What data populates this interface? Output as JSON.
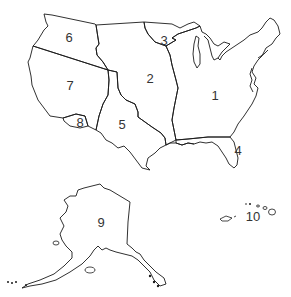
{
  "map": {
    "type": "outline-map",
    "subject": "United States divided into numbered regions",
    "stroke_color": "#1a1a1a",
    "background": "#ffffff",
    "regions": [
      {
        "id": "1",
        "label": "1",
        "area": "eastern-us"
      },
      {
        "id": "2",
        "label": "2",
        "area": "great-plains"
      },
      {
        "id": "3",
        "label": "3",
        "area": "upper-midwest"
      },
      {
        "id": "4",
        "label": "4",
        "area": "florida"
      },
      {
        "id": "5",
        "label": "5",
        "area": "texas-southwest"
      },
      {
        "id": "6",
        "label": "6",
        "area": "pacific-northwest"
      },
      {
        "id": "7",
        "label": "7",
        "area": "great-basin-california"
      },
      {
        "id": "8",
        "label": "8",
        "area": "southern-california"
      },
      {
        "id": "9",
        "label": "9",
        "area": "alaska"
      },
      {
        "id": "10",
        "label": "10",
        "area": "hawaii"
      }
    ]
  }
}
